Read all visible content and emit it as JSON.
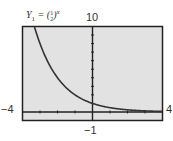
{
  "chart_data": {
    "type": "line",
    "function": "y = (1/2)^x",
    "xlabel": "",
    "ylabel": "",
    "xlim": [
      -4,
      4
    ],
    "ylim": [
      -1,
      10
    ],
    "tick_labels": {
      "xmin": "-4",
      "xmax": "4",
      "ymin": "-1",
      "ymax": "10"
    },
    "x_ticks": [
      -4,
      -3,
      -2,
      -1,
      0,
      1,
      2,
      3,
      4
    ],
    "y_ticks": [
      1,
      2,
      3,
      4,
      5,
      6,
      7,
      8,
      9,
      10
    ],
    "grid": false,
    "series": [
      {
        "name": "Y1",
        "x": [
          -3.32,
          -3,
          -2.5,
          -2,
          -1.5,
          -1,
          -0.5,
          0,
          0.5,
          1,
          1.5,
          2,
          2.5,
          3,
          3.5,
          4
        ],
        "values": [
          10,
          8,
          5.66,
          4,
          2.83,
          2,
          1.41,
          1,
          0.71,
          0.5,
          0.35,
          0.25,
          0.18,
          0.125,
          0.09,
          0.0625
        ]
      }
    ],
    "colors": {
      "screen_bg": "#e2e2e2",
      "curve": "#333333",
      "axes": "#222222",
      "border": "#222222"
    }
  },
  "labels": {
    "y_label_prefix": "Y",
    "y_label_sub": "1",
    "eq_sign": " = (",
    "frac_num": "1",
    "frac_den": "2",
    "eq_close": ")",
    "exponent": "x",
    "ymax": "10",
    "ymin": "−1",
    "xmin": "−4",
    "xmax": "4"
  }
}
